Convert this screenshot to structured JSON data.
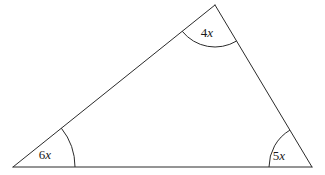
{
  "figure": {
    "type": "triangle-angle-diagram",
    "background_color": "#ffffff",
    "stroke_color": "#2b2b2b",
    "stroke_width": 1,
    "text_color": "#1a1a1a",
    "width": 325,
    "height": 175,
    "vertices": {
      "bottom_left": {
        "name": "bottom-left-vertex",
        "x": 13,
        "y": 167
      },
      "apex": {
        "name": "apex-vertex",
        "x": 215,
        "y": 5
      },
      "bottom_right": {
        "name": "bottom-right-vertex",
        "x": 312,
        "y": 167
      }
    },
    "sides": [
      {
        "name": "base-side",
        "from": "bottom_left",
        "to": "bottom_right"
      },
      {
        "name": "left-side",
        "from": "bottom_left",
        "to": "apex"
      },
      {
        "name": "right-side",
        "from": "apex",
        "to": "bottom_right"
      }
    ],
    "angles": [
      {
        "name": "angle-bottom-left",
        "label": "6x",
        "coefficient": "6",
        "variable": "x",
        "vertex": "bottom_left",
        "arc_radius": 62,
        "label_x": 45,
        "label_y": 159
      },
      {
        "name": "angle-apex",
        "label": "4x",
        "coefficient": "4",
        "variable": "x",
        "vertex": "apex",
        "arc_radius": 42,
        "label_x": 207,
        "label_y": 37
      },
      {
        "name": "angle-bottom-right",
        "label": "5x",
        "coefficient": "5",
        "variable": "x",
        "vertex": "bottom_right",
        "arc_radius": 43,
        "label_x": 279,
        "label_y": 160
      }
    ]
  }
}
